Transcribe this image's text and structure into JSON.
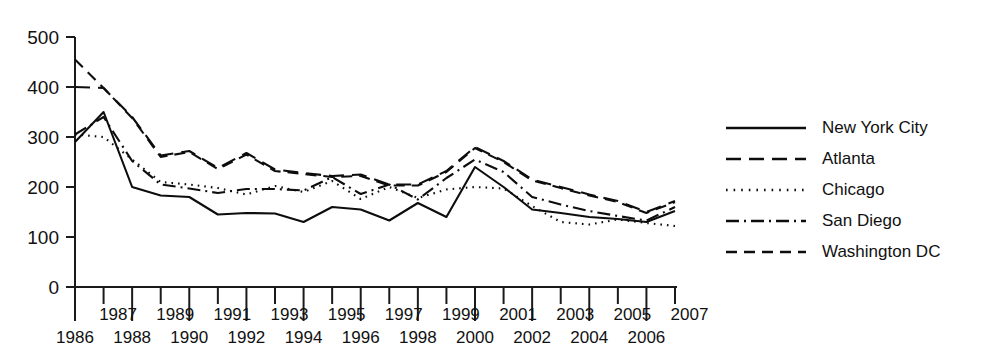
{
  "chart_data": {
    "type": "line",
    "title": "",
    "xlabel": "",
    "ylabel": "",
    "xlim": [
      1986,
      2007
    ],
    "ylim": [
      0,
      500
    ],
    "grid": false,
    "legend_position": "right",
    "x": [
      1986,
      1987,
      1988,
      1989,
      1990,
      1991,
      1992,
      1993,
      1994,
      1995,
      1996,
      1997,
      1998,
      1999,
      2000,
      2001,
      2002,
      2003,
      2004,
      2005,
      2006,
      2007
    ],
    "x_tick_labels_upper": [
      "",
      "1987",
      "",
      "1989",
      "",
      "1991",
      "",
      "1993",
      "",
      "1995",
      "",
      "1997",
      "",
      "1999",
      "",
      "2001",
      "",
      "2003",
      "",
      "2005",
      "",
      "2007"
    ],
    "x_tick_labels_lower": [
      "1986",
      "",
      "1988",
      "",
      "1990",
      "",
      "1992",
      "",
      "1994",
      "",
      "1996",
      "",
      "1998",
      "",
      "2000",
      "",
      "2002",
      "",
      "2004",
      "",
      "2006",
      ""
    ],
    "y_ticks": [
      0,
      100,
      200,
      300,
      400,
      500
    ],
    "y_tick_labels": [
      "0",
      "100",
      "200",
      "300",
      "400",
      "500"
    ],
    "series": [
      {
        "name": "New York City",
        "dash_style": "solid",
        "values": [
          290,
          350,
          200,
          183,
          180,
          145,
          148,
          147,
          130,
          160,
          155,
          133,
          168,
          140,
          240,
          200,
          155,
          148,
          140,
          136,
          130,
          152
        ]
      },
      {
        "name": "Atlanta",
        "dash_style": "long-dash",
        "values": [
          400,
          398,
          340,
          263,
          272,
          238,
          268,
          235,
          228,
          222,
          225,
          205,
          205,
          232,
          280,
          252,
          215,
          200,
          185,
          172,
          150,
          172
        ]
      },
      {
        "name": "Chicago",
        "dash_style": "dotted",
        "values": [
          305,
          300,
          255,
          210,
          205,
          198,
          185,
          202,
          190,
          212,
          176,
          200,
          178,
          195,
          200,
          197,
          162,
          130,
          125,
          135,
          128,
          122
        ]
      },
      {
        "name": "San Diego",
        "dash_style": "dash-dot",
        "values": [
          305,
          340,
          252,
          205,
          197,
          188,
          196,
          196,
          193,
          220,
          186,
          205,
          175,
          218,
          255,
          230,
          180,
          165,
          152,
          142,
          133,
          160
        ]
      },
      {
        "name": "Washington DC",
        "dash_style": "medium-dash",
        "values": [
          455,
          398,
          338,
          260,
          270,
          236,
          265,
          232,
          226,
          220,
          222,
          203,
          203,
          230,
          278,
          250,
          213,
          198,
          183,
          170,
          148,
          170
        ]
      }
    ]
  },
  "legend": {
    "entries": [
      {
        "label": "New York City"
      },
      {
        "label": "Atlanta"
      },
      {
        "label": "Chicago"
      },
      {
        "label": "San Diego"
      },
      {
        "label": "Washington DC"
      }
    ]
  },
  "colors": {
    "line": "#0d0d0d",
    "axis": "#1a1a1a",
    "background": "#ffffff"
  }
}
